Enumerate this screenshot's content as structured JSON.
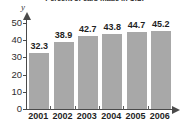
{
  "chart_data": {
    "type": "bar",
    "title": "Percent of cars made in U.S.",
    "categories": [
      "2001",
      "2002",
      "2003",
      "2004",
      "2005",
      "2006"
    ],
    "values": [
      32.3,
      38.9,
      42.7,
      43.8,
      44.7,
      45.2
    ],
    "value_labels": [
      "32.3",
      "38.9",
      "42.7",
      "43.8",
      "44.7",
      "45.2"
    ],
    "xlabel": "",
    "ylabel": "y",
    "ylim": [
      0,
      50
    ],
    "y_ticks": [
      0,
      10,
      20,
      30,
      40,
      50
    ],
    "y_tick_labels": [
      "0",
      "10",
      "20",
      "30",
      "40",
      "50"
    ],
    "grid": false,
    "legend": false,
    "bar_color": "#a8a8a8",
    "axis_color": "#4a4a4a",
    "text_color": "#1f1f1f",
    "background": "#ffffff"
  }
}
